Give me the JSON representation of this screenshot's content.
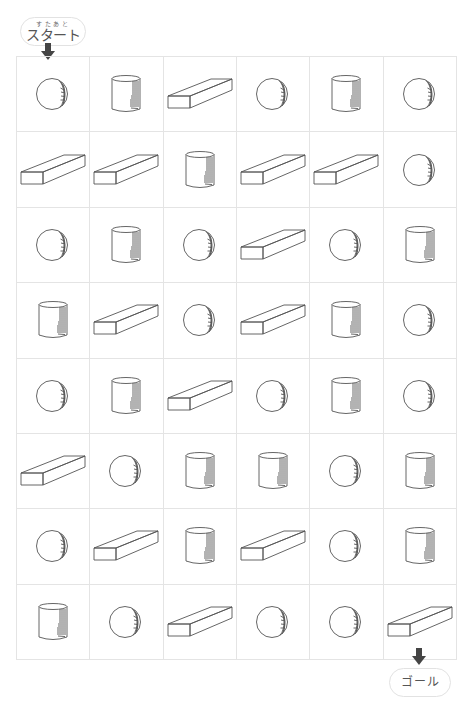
{
  "start": {
    "ruby": "すたあと",
    "label": "スタート"
  },
  "goal": {
    "label": "ゴール"
  },
  "colors": {
    "grid_line": "#e4e4e4",
    "shape_stroke": "#555555",
    "arrow": "#444444"
  },
  "grid": {
    "columns": 6,
    "rows": 8,
    "cells": [
      [
        "sphere",
        "cylinder",
        "box",
        "sphere",
        "cylinder",
        "sphere"
      ],
      [
        "box",
        "box",
        "cylinder",
        "box",
        "box",
        "sphere"
      ],
      [
        "sphere",
        "cylinder",
        "sphere",
        "box",
        "sphere",
        "cylinder"
      ],
      [
        "cylinder",
        "box",
        "sphere",
        "box",
        "cylinder",
        "sphere"
      ],
      [
        "sphere",
        "cylinder",
        "box",
        "sphere",
        "cylinder",
        "sphere"
      ],
      [
        "box",
        "sphere",
        "cylinder",
        "cylinder",
        "sphere",
        "cylinder"
      ],
      [
        "sphere",
        "box",
        "cylinder",
        "box",
        "sphere",
        "cylinder"
      ],
      [
        "cylinder",
        "sphere",
        "box",
        "sphere",
        "sphere",
        "box"
      ]
    ]
  }
}
